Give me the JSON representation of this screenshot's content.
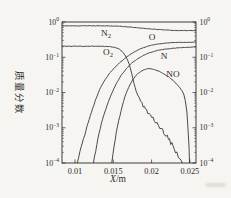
{
  "figure": {
    "background": "#f6f5f1",
    "ink": "#2b2b2b",
    "y_axis_title": "质量分数",
    "x_axis_title_variable": "X",
    "x_axis_title_unit": "/m"
  },
  "chart_data": {
    "type": "line",
    "title": "",
    "xlabel": "X/m",
    "ylabel": "质量分数",
    "x_scale": "linear",
    "y_scale": "log",
    "xlim": [
      0.0083,
      0.0258
    ],
    "ylim": [
      0.0001,
      1
    ],
    "x_ticks": [
      0.01,
      0.015,
      0.02,
      0.025
    ],
    "x_tick_labels": [
      "0.01",
      "0.015",
      "0.02",
      "0.025"
    ],
    "y_tick_exponents": [
      0,
      -1,
      -2,
      -3,
      -4
    ],
    "y_tick_labels": [
      "10^0",
      "10^-1",
      "10^-2",
      "10^-3",
      "10^-4"
    ],
    "y_axis_sides": [
      "left",
      "right"
    ],
    "grid": false,
    "legend": "inline-curve-labels",
    "series": [
      {
        "name": "N2",
        "label": "N",
        "label_sub": "2",
        "label_px": [
          106,
          33
        ],
        "points": [
          [
            0.0083,
            0.78
          ],
          [
            0.012,
            0.78
          ],
          [
            0.014,
            0.775
          ],
          [
            0.0155,
            0.765
          ],
          [
            0.0165,
            0.74
          ],
          [
            0.0175,
            0.71
          ],
          [
            0.0185,
            0.675
          ],
          [
            0.0195,
            0.645
          ],
          [
            0.0205,
            0.62
          ],
          [
            0.0215,
            0.6
          ],
          [
            0.0225,
            0.585
          ],
          [
            0.0235,
            0.575
          ],
          [
            0.0245,
            0.57
          ],
          [
            0.0258,
            0.575
          ]
        ]
      },
      {
        "name": "O2",
        "label": "O",
        "label_sub": "2",
        "label_px": [
          108,
          52
        ],
        "points": [
          [
            0.0083,
            0.205
          ],
          [
            0.013,
            0.205
          ],
          [
            0.0145,
            0.2
          ],
          [
            0.0152,
            0.19
          ],
          [
            0.0158,
            0.17
          ],
          [
            0.0163,
            0.135
          ],
          [
            0.0167,
            0.1
          ],
          [
            0.0171,
            0.062
          ],
          [
            0.0174,
            0.035
          ],
          [
            0.0177,
            0.018
          ],
          [
            0.018,
            0.0105
          ],
          [
            0.0184,
            0.0066
          ],
          [
            0.0189,
            0.0042
          ],
          [
            0.0195,
            0.0028
          ],
          [
            0.0202,
            0.0018
          ],
          [
            0.0209,
            0.00115
          ],
          [
            0.0216,
            0.00072
          ],
          [
            0.0222,
            0.00046
          ],
          [
            0.0228,
            0.0003
          ],
          [
            0.0233,
            0.0002
          ],
          [
            0.0237,
            0.000135
          ],
          [
            0.024,
            0.0001
          ]
        ]
      },
      {
        "name": "O",
        "label": "O",
        "label_sub": "",
        "label_px": [
          152,
          37
        ],
        "points": [
          [
            0.0103,
            0.0001
          ],
          [
            0.0108,
            0.00028
          ],
          [
            0.0114,
            0.0008
          ],
          [
            0.012,
            0.0022
          ],
          [
            0.0126,
            0.0055
          ],
          [
            0.0132,
            0.012
          ],
          [
            0.0138,
            0.021
          ],
          [
            0.0145,
            0.035
          ],
          [
            0.0152,
            0.052
          ],
          [
            0.016,
            0.075
          ],
          [
            0.0168,
            0.105
          ],
          [
            0.0177,
            0.14
          ],
          [
            0.0186,
            0.175
          ],
          [
            0.0195,
            0.207
          ],
          [
            0.0205,
            0.232
          ],
          [
            0.0216,
            0.25
          ],
          [
            0.0228,
            0.26
          ],
          [
            0.0242,
            0.265
          ],
          [
            0.0258,
            0.267
          ]
        ]
      },
      {
        "name": "N",
        "label": "N",
        "label_sub": "",
        "label_px": [
          164,
          56
        ],
        "points": [
          [
            0.0124,
            0.0001
          ],
          [
            0.013,
            0.0005
          ],
          [
            0.0136,
            0.0018
          ],
          [
            0.0142,
            0.0045
          ],
          [
            0.0148,
            0.0095
          ],
          [
            0.0154,
            0.018
          ],
          [
            0.016,
            0.03
          ],
          [
            0.0167,
            0.047
          ],
          [
            0.0174,
            0.068
          ],
          [
            0.0182,
            0.092
          ],
          [
            0.019,
            0.115
          ],
          [
            0.0199,
            0.138
          ],
          [
            0.0209,
            0.158
          ],
          [
            0.022,
            0.172
          ],
          [
            0.0233,
            0.184
          ],
          [
            0.0246,
            0.192
          ],
          [
            0.0258,
            0.196
          ]
        ]
      },
      {
        "name": "NO",
        "label": "NO",
        "label_sub": "",
        "label_px": [
          173,
          74
        ],
        "points": [
          [
            0.0148,
            0.0001
          ],
          [
            0.0154,
            0.0008
          ],
          [
            0.016,
            0.003
          ],
          [
            0.0165,
            0.0075
          ],
          [
            0.017,
            0.014
          ],
          [
            0.0175,
            0.022
          ],
          [
            0.018,
            0.031
          ],
          [
            0.0186,
            0.04
          ],
          [
            0.0192,
            0.046
          ],
          [
            0.0198,
            0.048
          ],
          [
            0.0204,
            0.0445
          ],
          [
            0.021,
            0.04
          ],
          [
            0.0216,
            0.034
          ],
          [
            0.0222,
            0.028
          ],
          [
            0.0228,
            0.022
          ],
          [
            0.0233,
            0.017
          ],
          [
            0.0237,
            0.0135
          ],
          [
            0.024,
            0.011
          ],
          [
            0.0242,
            0.009
          ],
          [
            0.0244,
            0.006
          ],
          [
            0.0246,
            0.003
          ],
          [
            0.0247,
            0.0015
          ],
          [
            0.0248,
            0.0006
          ],
          [
            0.0249,
            0.00025
          ],
          [
            0.02495,
            0.0001
          ]
        ]
      }
    ]
  }
}
